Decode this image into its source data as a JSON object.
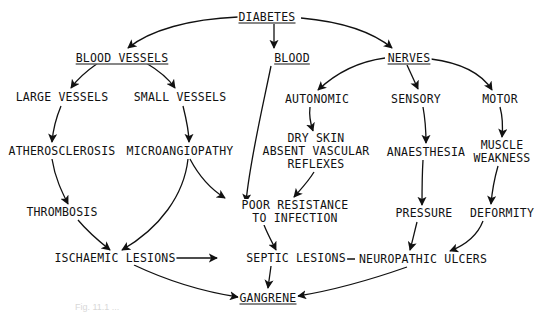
{
  "diagram": {
    "colors": {
      "ink": "#111111",
      "background": "#ffffff",
      "caption": "#d8d8d8"
    },
    "nodes": {
      "diabetes": {
        "lines": [
          "DIABETES"
        ],
        "underlined": true,
        "x": 267,
        "y": 17
      },
      "blood_vessels": {
        "lines": [
          "BLOOD VESSELS"
        ],
        "underlined": true,
        "x": 122,
        "y": 58
      },
      "blood": {
        "lines": [
          "BLOOD"
        ],
        "underlined": true,
        "x": 292,
        "y": 58
      },
      "nerves": {
        "lines": [
          "NERVES"
        ],
        "underlined": true,
        "x": 409,
        "y": 58
      },
      "large_vessels": {
        "lines": [
          "LARGE VESSELS"
        ],
        "x": 62,
        "y": 97
      },
      "small_vessels": {
        "lines": [
          "SMALL VESSELS"
        ],
        "x": 180,
        "y": 97
      },
      "autonomic": {
        "lines": [
          "AUTONOMIC"
        ],
        "x": 317,
        "y": 99
      },
      "sensory": {
        "lines": [
          "SENSORY"
        ],
        "x": 416,
        "y": 99
      },
      "motor": {
        "lines": [
          "MOTOR"
        ],
        "x": 500,
        "y": 99
      },
      "atherosclerosis": {
        "lines": [
          "ATHEROSCLEROSIS"
        ],
        "x": 62,
        "y": 151
      },
      "microangiopathy": {
        "lines": [
          "MICROANGIOPATHY"
        ],
        "x": 180,
        "y": 151
      },
      "dry_skin": {
        "lines": [
          "DRY SKIN",
          "ABSENT VASCULAR",
          "REFLEXES"
        ],
        "x": 316,
        "y": 151
      },
      "anaesthesia": {
        "lines": [
          "ANAESTHESIA"
        ],
        "x": 426,
        "y": 152
      },
      "muscle_weakness": {
        "lines": [
          "MUSCLE",
          "WEAKNESS"
        ],
        "x": 502,
        "y": 152
      },
      "thrombosis": {
        "lines": [
          "THROMBOSIS"
        ],
        "x": 62,
        "y": 212
      },
      "poor_resistance": {
        "lines": [
          "POOR RESISTANCE",
          "TO INFECTION"
        ],
        "x": 295,
        "y": 212
      },
      "pressure": {
        "lines": [
          "PRESSURE"
        ],
        "x": 424,
        "y": 213
      },
      "deformity": {
        "lines": [
          "DEFORMITY"
        ],
        "x": 502,
        "y": 213
      },
      "ischaemic": {
        "lines": [
          "ISCHAEMIC LESIONS"
        ],
        "x": 115,
        "y": 258
      },
      "septic": {
        "lines": [
          "SEPTIC LESIONS"
        ],
        "x": 296,
        "y": 258
      },
      "neuropathic": {
        "lines": [
          "NEUROPATHIC ULCERS"
        ],
        "x": 423,
        "y": 259
      },
      "gangrene": {
        "lines": [
          "GANGRENE"
        ],
        "underlined": true,
        "x": 268,
        "y": 298
      }
    },
    "edges": [
      {
        "from": "diabetes",
        "to": "blood_vessels",
        "d": "M238,17 C190,19 150,30 128,48"
      },
      {
        "from": "diabetes",
        "to": "blood",
        "d": "M274,24 L274,48"
      },
      {
        "from": "diabetes",
        "to": "nerves",
        "d": "M301,18 C345,22 375,34 392,48"
      },
      {
        "from": "blood_vessels",
        "to": "large_vessels",
        "d": "M98,63 C88,70 78,78 71,88"
      },
      {
        "from": "blood_vessels",
        "to": "small_vessels",
        "d": "M146,63 C158,70 168,78 175,88"
      },
      {
        "from": "nerves",
        "to": "autonomic",
        "d": "M385,58 C355,62 335,74 318,90"
      },
      {
        "from": "nerves",
        "to": "sensory",
        "d": "M407,65 L418,89"
      },
      {
        "from": "nerves",
        "to": "motor",
        "d": "M431,59 C462,63 482,74 492,90"
      },
      {
        "from": "large_vessels",
        "to": "atherosclerosis",
        "d": "M61,106 C56,118 53,130 52,142"
      },
      {
        "from": "small_vessels",
        "to": "microangiopathy",
        "d": "M183,106 C186,118 189,130 189,142"
      },
      {
        "from": "autonomic",
        "to": "dry_skin",
        "d": "M310,107 C309,115 310,122 313,131"
      },
      {
        "from": "sensory",
        "to": "anaesthesia",
        "d": "M423,107 C425,118 426,128 426,143"
      },
      {
        "from": "motor",
        "to": "muscle_weakness",
        "d": "M500,107 C503,118 503,126 502,137"
      },
      {
        "from": "atherosclerosis",
        "to": "thrombosis",
        "d": "M52,159 C55,178 62,192 68,204"
      },
      {
        "from": "microangiopathy",
        "to": "poor_resistance",
        "d": "M190,159 C200,178 212,190 225,198"
      },
      {
        "from": "microangiopathy",
        "to": "ischaemic",
        "d": "M188,159 C184,195 160,228 122,250"
      },
      {
        "from": "blood",
        "to": "poor_resistance",
        "d": "M271,66 C262,110 250,160 246,202"
      },
      {
        "from": "dry_skin",
        "to": "poor_resistance",
        "d": "M314,172 C308,182 300,190 294,197"
      },
      {
        "from": "anaesthesia",
        "to": "pressure",
        "d": "M423,160 C422,176 422,190 422,205"
      },
      {
        "from": "muscle_weakness",
        "to": "deformity",
        "d": "M498,166 C494,180 492,192 491,204"
      },
      {
        "from": "thrombosis",
        "to": "ischaemic",
        "d": "M78,220 C88,232 100,242 110,250"
      },
      {
        "from": "poor_resistance",
        "to": "septic",
        "d": "M264,225 C268,235 272,242 276,250"
      },
      {
        "from": "ischaemic",
        "to": "septic",
        "d": "M175,258 L217,258"
      },
      {
        "from": "neuropathic",
        "to": "septic",
        "d": "M355,259 L318,259"
      },
      {
        "from": "pressure",
        "to": "neuropathic",
        "d": "M417,222 C414,234 412,243 410,250"
      },
      {
        "from": "deformity",
        "to": "neuropathic",
        "d": "M483,221 C478,234 468,244 450,251"
      },
      {
        "from": "septic",
        "to": "gangrene",
        "d": "M271,266 C270,274 269,280 268,288"
      },
      {
        "from": "ischaemic",
        "to": "gangrene",
        "d": "M134,265 C170,282 205,292 238,297"
      },
      {
        "from": "neuropathic",
        "to": "gangrene",
        "d": "M407,267 C370,280 335,290 298,296"
      }
    ],
    "caption": "Fig. 11.1 ..."
  }
}
